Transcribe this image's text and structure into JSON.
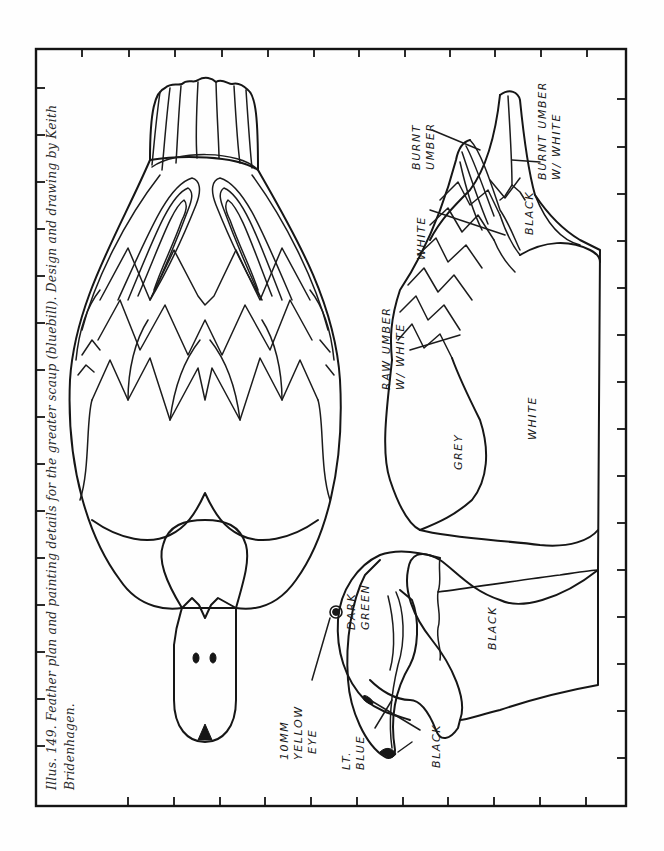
{
  "caption": {
    "line1": "Illus. 149. Feather plan and painting details for the greater scaup (bluebill). Design and drawing by Keith",
    "line2": "Bridenhagen."
  },
  "frame": {
    "left": 36,
    "top": 49,
    "right": 626,
    "bottom": 806,
    "top_ticks_x": [
      82,
      129,
      175,
      222,
      268,
      314,
      359,
      405,
      450,
      495,
      541,
      587
    ],
    "bottom_ticks_x": [
      128,
      174,
      220,
      265,
      311,
      357,
      403,
      448,
      494,
      540,
      586
    ],
    "left_ticks_y": [
      88,
      135,
      182,
      229,
      276,
      323,
      370,
      417,
      464,
      511,
      558,
      605,
      652,
      699,
      746
    ],
    "right_ticks_y": [
      99,
      147,
      194,
      241,
      288,
      335,
      382,
      429,
      476,
      523,
      570,
      617,
      664,
      711,
      758
    ]
  },
  "drawings": {
    "top_view": {
      "name": "Feather plan (top view)"
    },
    "side_view": {
      "name": "Painting details (side view)"
    }
  },
  "labels": {
    "burnt_umber_white_1": "BURNT UMBER",
    "burnt_umber_white_2": "W/ WHITE",
    "burnt_umber_1": "BURNT",
    "burnt_umber_2": "UMBER",
    "white_wing": "WHITE",
    "black_tail": "BLACK",
    "raw_umber_1": "RAW UMBER",
    "raw_umber_2": "W/ WHITE",
    "grey": "GREY",
    "white_side": "WHITE",
    "dark_green_1": "DARK",
    "dark_green_2": "GREEN",
    "black_breast": "BLACK",
    "eye_1": "10MM",
    "eye_2": "YELLOW",
    "eye_3": "EYE",
    "lt_blue_1": "LT.",
    "lt_blue_2": "BLUE",
    "black_nail": "BLACK"
  }
}
